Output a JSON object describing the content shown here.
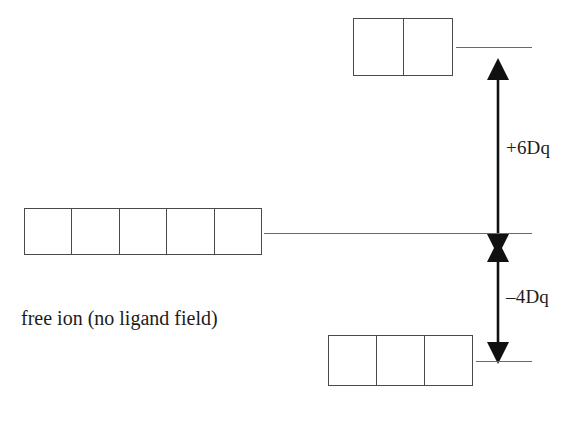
{
  "diagram": {
    "type": "crystal-field-splitting",
    "title": "",
    "background_color": "#ffffff",
    "line_color": "#4a4a4a",
    "text_color": "#1c1c1c",
    "caption": "free ion (no ligand field)",
    "levels": {
      "upper": {
        "name": "upper-orbital-set",
        "cell_count": 2,
        "label": "",
        "splitting": "+6Dq"
      },
      "free_ion": {
        "name": "free-ion-orbital-set",
        "cell_count": 5,
        "label": "free ion (no ligand field)"
      },
      "lower": {
        "name": "lower-orbital-set",
        "cell_count": 3,
        "label": "",
        "splitting": "-4Dq"
      }
    },
    "arrows": {
      "upper": {
        "label": "+6Dq",
        "direction": "double-headed-vertical"
      },
      "lower": {
        "label": "–4Dq",
        "direction": "double-headed-vertical"
      }
    }
  },
  "chart_data": {
    "type": "diagram",
    "categories": [
      "upper set (e_g)",
      "barycenter (free ion)",
      "lower set (t_2g)"
    ],
    "values": [
      6,
      0,
      -4
    ],
    "value_labels": [
      "+6Dq",
      "",
      "–4Dq"
    ],
    "degeneracies": [
      2,
      5,
      3
    ],
    "xlabel": "",
    "ylabel": "Energy (Dq)",
    "annotations": [
      "free ion (no ligand field)",
      "+6Dq",
      "–4Dq"
    ],
    "grid": false,
    "legend": "none"
  }
}
